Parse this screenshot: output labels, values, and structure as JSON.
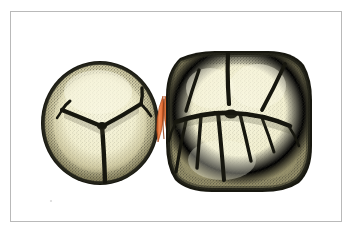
{
  "figure": {
    "title": "Occlusal view of two adjacent teeth with interproximal contact area",
    "subject": "teeth",
    "view": "occlusal",
    "technique": "stippled pen-and-ink scientific illustration",
    "background_color": "#ffffff",
    "frame": {
      "present": true,
      "color": "#b9b9b9",
      "thickness_px": 1,
      "inset_left_px": 10,
      "inset_top_px": 11,
      "width_px": 332,
      "height_px": 211
    },
    "palette": {
      "enamel_fill": "#f4f2d6",
      "enamel_fill_shadow": "#e3dfb4",
      "outline_dark": "#1a1a16",
      "stipple": "#3a3a30",
      "contact_orange": "#e8743c",
      "contact_orange_dark": "#c2561f",
      "paper_white": "#ffffff"
    },
    "elements": [
      {
        "id": "left-tooth",
        "label": "Left tooth (premolar, occlusal surface)",
        "shape": "near-circular",
        "center_x": 100,
        "center_y": 123,
        "radius_x": 58,
        "radius_y": 61,
        "fissure_pattern": "Y-shaped central groove with two short cusp forks",
        "cusps": 3
      },
      {
        "id": "contact-point",
        "label": "Interproximal contact area",
        "shape": "two opposed lens/leaf forms",
        "center_x": 163,
        "center_y": 118,
        "width": 16,
        "height": 44,
        "color": "#e8743c"
      },
      {
        "id": "right-tooth",
        "label": "Right tooth (molar, occlusal surface)",
        "shape": "rounded square",
        "center_x": 239,
        "center_y": 121,
        "half_width": 71,
        "half_height": 69,
        "fissure_pattern": "central transverse fissure with radiating branch grooves",
        "cusps": 5
      }
    ],
    "annotations": []
  }
}
